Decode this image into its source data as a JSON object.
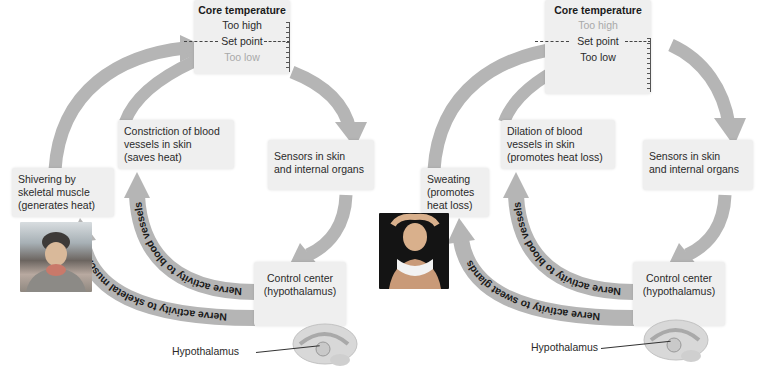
{
  "left_diagram": {
    "core_box": {
      "title": "Core temperature",
      "too_high": "Too high",
      "set_point": "Set point",
      "too_low": "Too low",
      "active_state": "too_low"
    },
    "sensors_label": "Sensors in skin\nand internal organs",
    "control_center_label": "Control center\n(hypothalamus)",
    "effector_1_label": "Constriction of blood\nvessels in skin\n(saves heat)",
    "effector_2_label": "Shivering by\nskeletal muscle\n(generates heat)",
    "nerve_1_label": "Nerve activity to blood vessels",
    "nerve_2_label": "Nerve activity to skeletal muscle",
    "brain_label": "Hypothalamus",
    "photo_subject": "person-in-winter-hat-shivering"
  },
  "right_diagram": {
    "core_box": {
      "title": "Core temperature",
      "too_high": "Too high",
      "set_point": "Set point",
      "too_low": "Too low",
      "active_state": "too_high"
    },
    "sensors_label": "Sensors in skin\nand internal organs",
    "control_center_label": "Control center\n(hypothalamus)",
    "effector_1_label": "Dilation of blood\nvessels in skin\n(promotes heat loss)",
    "effector_2_label": "Sweating\n(promotes\nheat loss)",
    "nerve_1_label": "Nerve activity to blood vessels",
    "nerve_2_label": "Nerve activity to sweat glands",
    "brain_label": "Hypothalamus",
    "photo_subject": "person-with-towel-sweating"
  },
  "colors": {
    "arrow": "#b5b5b5",
    "box_bg": "#efefef",
    "text": "#2a2a2a",
    "dim_text": "#a9a9a9"
  }
}
